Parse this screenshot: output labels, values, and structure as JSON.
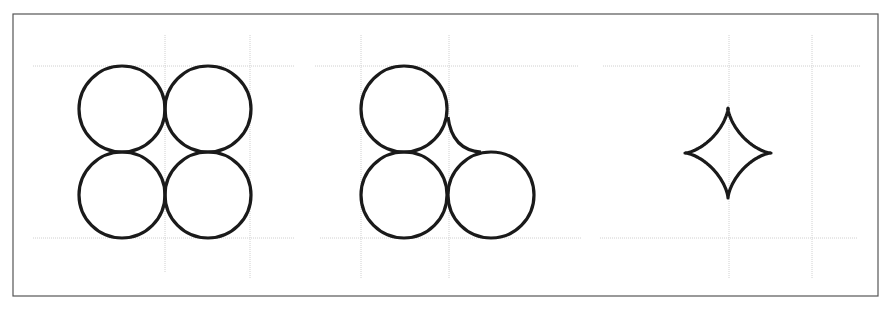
{
  "diagram": {
    "title": "",
    "frame": {
      "x": 13,
      "y": 14,
      "width": 865,
      "height": 282,
      "stroke": "#555555"
    },
    "colors": {
      "shape_stroke": "#1a1a1a",
      "grid": "#d0d0d0",
      "background": "#ffffff"
    },
    "panels": [
      {
        "name": "four-circles",
        "description": "Four tangent circles arranged in a 2x2 grid",
        "circles": [
          {
            "cx": 122,
            "cy": 109,
            "r": 43
          },
          {
            "cx": 208,
            "cy": 109,
            "r": 43
          },
          {
            "cx": 122,
            "cy": 195,
            "r": 43
          },
          {
            "cx": 208,
            "cy": 195,
            "r": 43
          }
        ],
        "grid_h": [
          {
            "x1": 33,
            "x2": 295,
            "y": 66
          },
          {
            "x1": 33,
            "x2": 295,
            "y": 238
          }
        ],
        "grid_v": [
          {
            "x": 165,
            "y1": 35,
            "y2": 273
          },
          {
            "x": 250,
            "y1": 35,
            "y2": 278
          }
        ]
      },
      {
        "name": "three-circles-with-fillet",
        "description": "Three tangent circles with a concave fillet joining the top and bottom-right circles",
        "circles": [
          {
            "cx": 404,
            "cy": 109,
            "r": 43
          },
          {
            "cx": 404,
            "cy": 195,
            "r": 43
          },
          {
            "cx": 491,
            "cy": 195,
            "r": 43
          }
        ],
        "fillet": {
          "from": [
            448,
            117
          ],
          "to": [
            481,
            152
          ]
        },
        "grid_h": [
          {
            "x1": 315,
            "x2": 578,
            "y": 66
          },
          {
            "x1": 320,
            "x2": 582,
            "y": 238
          }
        ],
        "grid_v": [
          {
            "x": 361,
            "y1": 35,
            "y2": 278
          },
          {
            "x": 449,
            "y1": 35,
            "y2": 278
          }
        ]
      },
      {
        "name": "astroid-star",
        "description": "Four-pointed concave star (astroid) formed by the gap between four circles",
        "center": {
          "x": 728,
          "y": 153
        },
        "half_width": 43,
        "half_height": 45,
        "grid_h": [
          {
            "x1": 603,
            "x2": 860,
            "y": 66
          },
          {
            "x1": 600,
            "x2": 858,
            "y": 238
          }
        ],
        "grid_v": [
          {
            "x": 729,
            "y1": 35,
            "y2": 278
          },
          {
            "x": 812,
            "y1": 35,
            "y2": 278
          }
        ]
      }
    ]
  }
}
